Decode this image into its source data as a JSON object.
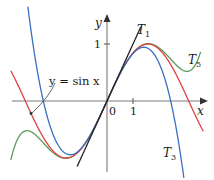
{
  "figure": {
    "axes": {
      "x_label": "x",
      "y_label": "y",
      "origin_label": "0",
      "x_tick_label": "1",
      "y_tick_label": "1"
    },
    "curve_labels": {
      "sin": "y = sin x",
      "t1_main": "T",
      "t1_sub": "1",
      "t3_main": "T",
      "t3_sub": "3",
      "t5_main": "T",
      "t5_sub": "5"
    },
    "colors": {
      "sin": "#e04040",
      "t1": "#222222",
      "t3": "#3a6fc0",
      "t5": "#5a9a5a",
      "axis": "#777777"
    }
  },
  "chart_data": {
    "type": "line",
    "title": "",
    "xlabel": "x",
    "ylabel": "y",
    "xlim": [
      -4.1,
      4.1
    ],
    "ylim": [
      -1.4,
      1.75
    ],
    "grid": false,
    "series": [
      {
        "name": "y = sin x",
        "function": "sin(x)",
        "color": "#e04040"
      },
      {
        "name": "T1",
        "function": "x",
        "color": "#222222"
      },
      {
        "name": "T3",
        "function": "x - x^3/6",
        "color": "#3a6fc0"
      },
      {
        "name": "T5",
        "function": "x - x^3/6 + x^5/120",
        "color": "#5a9a5a"
      }
    ],
    "annotations": [
      "y = sin x",
      "T1",
      "T3",
      "T5",
      "0",
      "1",
      "1"
    ]
  }
}
